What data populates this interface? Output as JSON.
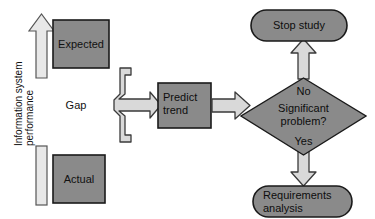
{
  "diagram": {
    "colors": {
      "node_fill": "#8a8a8a",
      "node_stroke": "#1a1a1a",
      "arrow_fill": "#d9d9d9",
      "arrow_stroke": "#2b2b2b",
      "bar_fill": "#e8e8e8",
      "bar_stroke": "#4d4d4d",
      "background": "#ffffff",
      "text": "#111111"
    },
    "axis": {
      "label_line1": "Information system",
      "label_line2": "performance",
      "arrow_name": "up-arrow",
      "bar_name": "baseline-bar"
    },
    "nodes": {
      "expected": {
        "label": "Expected",
        "shape": "rectangle"
      },
      "actual": {
        "label": "Actual",
        "shape": "rectangle"
      },
      "gap": {
        "label": "Gap",
        "shape": "text"
      },
      "predict_trend": {
        "label_line1": "Predict",
        "label_line2": "trend",
        "shape": "rectangle"
      },
      "decision": {
        "label_line1": "Significant",
        "label_line2": "problem?",
        "shape": "diamond"
      },
      "stop_study": {
        "label": "Stop study",
        "shape": "stadium"
      },
      "requirements": {
        "label_line1": "Requirements",
        "label_line2": "analysis",
        "shape": "stadium"
      }
    },
    "branches": {
      "no": "No",
      "yes": "Yes"
    },
    "connectors": [
      {
        "name": "brace-to-predict-arrow",
        "from": "gap",
        "to": "predict_trend"
      },
      {
        "name": "predict-to-decision-arrow",
        "from": "predict_trend",
        "to": "decision"
      },
      {
        "name": "decision-to-stop-arrow",
        "from": "decision",
        "to": "stop_study"
      },
      {
        "name": "decision-to-requirements-arrow",
        "from": "decision",
        "to": "requirements"
      }
    ]
  }
}
